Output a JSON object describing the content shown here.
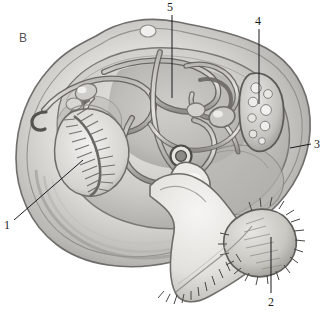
{
  "figure": {
    "panel_letter": "B",
    "style": "grayscale-pencil-illustration",
    "background_color": "#ffffff",
    "ink_color": "#1a1a1a"
  },
  "labels": [
    {
      "id": "1",
      "text": "1",
      "x": 4,
      "y": 219,
      "target": "ctenidium-gill",
      "leader": {
        "type": "diagonal",
        "x1": 14,
        "y1": 220,
        "x2": 83,
        "y2": 160
      }
    },
    {
      "id": "2",
      "text": "2",
      "x": 268,
      "y": 296,
      "target": "foot-ciliated",
      "leader": {
        "type": "vertical",
        "x1": 271,
        "y1": 293,
        "x2": 271,
        "y2": 237
      }
    },
    {
      "id": "3",
      "text": "3",
      "x": 314,
      "y": 138,
      "target": "mantle-edge",
      "leader": {
        "type": "horizontal",
        "x1": 311,
        "y1": 144,
        "x2": 290,
        "y2": 148
      }
    },
    {
      "id": "4",
      "text": "4",
      "x": 255,
      "y": 15,
      "target": "gonad-vesicles",
      "leader": {
        "type": "vertical",
        "x1": 259,
        "y1": 29,
        "x2": 259,
        "y2": 104
      }
    },
    {
      "id": "5",
      "text": "5",
      "x": 167,
      "y": 1,
      "target": "digestive-coil",
      "leader": {
        "type": "vertical",
        "x1": 172,
        "y1": 15,
        "x2": 172,
        "y2": 98
      }
    }
  ],
  "structures": [
    {
      "name": "shell-outer-rim",
      "description": "outer shell margin with concentric growth rings"
    },
    {
      "name": "mantle-cavity",
      "description": "broad pale body mass occupying shell interior"
    },
    {
      "name": "ctenidium-gill",
      "description": "comb-like gill with radiating filaments, lower left"
    },
    {
      "name": "digestive-coil",
      "description": "looping coiled gut tubes across upper body"
    },
    {
      "name": "gonad-vesicles",
      "description": "elongate organ containing rounded vesicles, upper right"
    },
    {
      "name": "heart-ring",
      "description": "small ringed circular structure at centre"
    },
    {
      "name": "foot",
      "description": "large muscular foot extending to lower right, fringed with bristles"
    }
  ],
  "palette": {
    "ink": "#1a1a1a",
    "mid_gray": "#8b8b8b",
    "light_gray": "#cfcfcf",
    "pale": "#e9e8e6",
    "shadow": "#6e6e6e",
    "panel_letter": "#5a5a5a"
  }
}
